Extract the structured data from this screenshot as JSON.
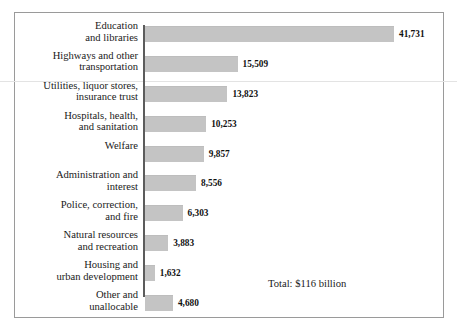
{
  "chart_data": {
    "type": "bar",
    "orientation": "horizontal",
    "title": "",
    "xlabel": "",
    "ylabel": "",
    "grid": false,
    "legend": null,
    "xlim": [
      0,
      41731
    ],
    "unit_note": "Total: $116 billion",
    "categories": [
      "Education\nand libraries",
      "Highways and other\ntransportation",
      "Utilities, liquor stores,\ninsurance trust",
      "Hospitals, health,\nand sanitation",
      "Welfare",
      "Administration and\ninterest",
      "Police, correction,\nand fire",
      "Natural resources\nand recreation",
      "Housing and\nurban development",
      "Other and\nunallocable"
    ],
    "values": [
      41731,
      15509,
      13823,
      10253,
      9857,
      8556,
      6303,
      3883,
      1632,
      4680
    ],
    "value_labels": [
      "41,731",
      "15,509",
      "13,823",
      "10,253",
      "9,857",
      "8,556",
      "6,303",
      "3,883",
      "1,632",
      "4,680"
    ],
    "bar_color": "#c4c4c4",
    "axis_color": "#5c5c5c",
    "frame_color": "#9a9a9a",
    "text_color": "#1a1a1a"
  },
  "annotations": {
    "total": "Total: $116 billion"
  }
}
